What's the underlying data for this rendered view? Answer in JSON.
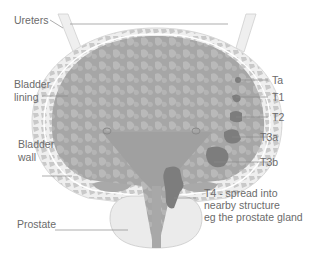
{
  "diagram": {
    "labels": {
      "ureters": "Ureters",
      "bladder_lining_1": "Bladder",
      "bladder_lining_2": "lining",
      "bladder_wall_1": "Bladder",
      "bladder_wall_2": "wall",
      "prostate": "Prostate",
      "ta": "Ta",
      "t1": "T1",
      "t2": "T2",
      "t3a": "T3a",
      "t3b": "T3b",
      "t4_1": "T4 - spread into",
      "t4_2": "nearby structure",
      "t4_3": "eg the prostate gland"
    },
    "colors": {
      "interior": "#a6a6a6",
      "interior_pattern": "#bdbdbd",
      "wall": "#e6e6e6",
      "wall_cells": "#c8c8c8",
      "tumour": "#7d7d7d",
      "prostate": "#ebebeb",
      "label_text": "#6b6b6b",
      "leader": "#8a8a8a"
    }
  }
}
